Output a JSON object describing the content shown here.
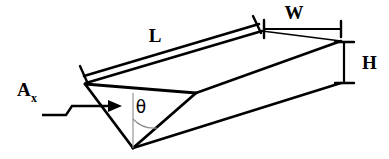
{
  "figure": {
    "background_color": "#ffffff",
    "line_color": "#000000",
    "guide_color": "#8c8c8c"
  },
  "labels": {
    "length": "L",
    "width": "W",
    "height": "H",
    "angle": "θ",
    "area_symbol": "A",
    "area_subscript": "x"
  },
  "dimensions": {
    "length_label": "L",
    "width_label": "W",
    "height_label": "H",
    "angle_label": "θ",
    "cross_section_label": "Ax"
  },
  "geometry": {
    "near_top_left": [
      83,
      82
    ],
    "near_top_right": [
      196,
      93
    ],
    "apex": [
      132,
      148
    ],
    "far_top_left": [
      258,
      25
    ],
    "far_top_right": [
      340,
      41
    ],
    "far_apex": [
      340,
      83
    ],
    "projection": "oblique"
  },
  "annotations": {
    "flow_arrow": "flow direction arrow entering trough",
    "angle_arc": "arc between vertical reference line and right V wall"
  }
}
